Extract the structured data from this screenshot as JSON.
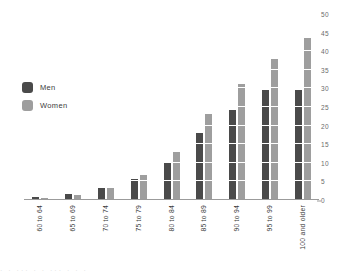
{
  "chart_data": {
    "type": "bar",
    "title": "",
    "subtitle": "",
    "xlabel": "",
    "ylabel": "",
    "categories": [
      "60 to 64",
      "65 to 69",
      "70 to 74",
      "75 to 79",
      "80 to 84",
      "85 to 89",
      "90 to 94",
      "95 to 99",
      "100 and older"
    ],
    "series": [
      {
        "name": "Men",
        "color": "#4a4a4a",
        "values": [
          0.8,
          1.5,
          3.2,
          5.6,
          10.3,
          17.9,
          24.2,
          29.7,
          29.7
        ]
      },
      {
        "name": "Women",
        "color": "#9e9e9e",
        "values": [
          0.6,
          1.3,
          3.1,
          6.8,
          12.8,
          23.1,
          31.3,
          38.0,
          43.6
        ]
      }
    ],
    "value_labels": [
      [
        "0.8",
        "0.6"
      ],
      [
        "1.5",
        "1.3"
      ],
      [
        "3.2",
        "3.1"
      ],
      [
        "5.6",
        "6.8"
      ],
      [
        "10.3",
        "12.8"
      ],
      [
        "17.9",
        "23.1"
      ],
      [
        "24.2",
        "31.3"
      ],
      [
        "29.7",
        "38.0"
      ],
      [
        "29.7",
        "43.6"
      ]
    ],
    "ylim": [
      0,
      50
    ],
    "yticks": [
      "0",
      "5",
      "10",
      "15",
      "20",
      "25",
      "30",
      "35",
      "40",
      "45",
      "50"
    ],
    "ytick_values": [
      0,
      5,
      10,
      15,
      20,
      25,
      30,
      35,
      40,
      45,
      50
    ],
    "yaxis_position": "right",
    "grid": true,
    "grid_orientation": "horizontal",
    "grid_color": "#ffffff",
    "legend_position": "top-left",
    "legend": [
      "Men",
      "Women"
    ],
    "axis_color": "#9b9b9b",
    "background": "#ffffff",
    "xlabel_rotation": -90,
    "value_label_rotation": -90
  },
  "legend": {
    "items": [
      {
        "label": "Men",
        "color": "#4a4a4a"
      },
      {
        "label": "Women",
        "color": "#9e9e9e"
      }
    ]
  },
  "footer": {
    "cutoff_text": "·  ·    ···      ·        ·    ···        ·          ·       ·"
  }
}
